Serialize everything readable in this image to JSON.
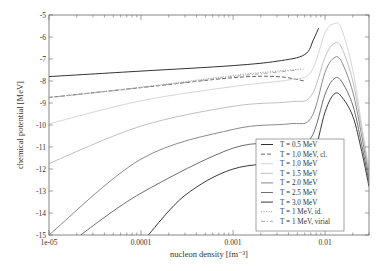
{
  "chart_data": {
    "type": "line",
    "title": "",
    "xlabel": "nucleon density [fm⁻³]",
    "ylabel": "chemical potential [MeV]",
    "xscale": "log",
    "xlim": [
      1e-05,
      0.03
    ],
    "ylim": [
      -15,
      -5
    ],
    "x_ticks": [
      {
        "value": 1e-05,
        "label": "1e-05"
      },
      {
        "value": 0.0001,
        "label": "0.0001"
      },
      {
        "value": 0.001,
        "label": "0.001"
      },
      {
        "value": 0.01,
        "label": "0.01"
      }
    ],
    "y_ticks": [
      {
        "value": -5,
        "label": "-5"
      },
      {
        "value": -6,
        "label": "-6"
      },
      {
        "value": -7,
        "label": "-7"
      },
      {
        "value": -8,
        "label": "-8"
      },
      {
        "value": -9,
        "label": "-9"
      },
      {
        "value": -10,
        "label": "-10"
      },
      {
        "value": -11,
        "label": "-11"
      },
      {
        "value": -12,
        "label": "-12"
      },
      {
        "value": -13,
        "label": "-13"
      },
      {
        "value": -14,
        "label": "-14"
      },
      {
        "value": -15,
        "label": "-15"
      }
    ],
    "grid": false,
    "legend_position": "bottom-right",
    "series": [
      {
        "name": "T = 0.5 MeV",
        "color": "#333333",
        "dash": "solid",
        "x": [
          1e-05,
          0.0001,
          0.001,
          0.003,
          0.006,
          0.0075,
          0.0085
        ],
        "y": [
          -7.8,
          -7.55,
          -7.3,
          -7.1,
          -6.8,
          -6.1,
          -5.6
        ]
      },
      {
        "name": "T = 1.0 MeV, cl.",
        "color": "#666666",
        "dash": "dashed",
        "x": [
          1e-05,
          0.0001,
          0.001,
          0.003,
          0.006
        ],
        "y": [
          -8.75,
          -8.3,
          -7.85,
          -7.8,
          -8.0
        ]
      },
      {
        "name": "T = 1.0 MeV",
        "color": "#d6d6d6",
        "dash": "solid",
        "x": [
          1e-05,
          0.0001,
          0.001,
          0.004,
          0.007,
          0.01,
          0.0125,
          0.015,
          0.02,
          0.025,
          0.03
        ],
        "y": [
          -9.95,
          -8.9,
          -8.25,
          -7.95,
          -7.6,
          -5.8,
          -5.4,
          -5.6,
          -7.5,
          -10.0,
          -12.0
        ]
      },
      {
        "name": "T = 1.5 MeV",
        "color": "#c0c0c0",
        "dash": "solid",
        "x": [
          1e-05,
          0.0001,
          0.001,
          0.004,
          0.007,
          0.01,
          0.0125,
          0.015,
          0.02,
          0.025,
          0.03
        ],
        "y": [
          -11.75,
          -10.05,
          -9.15,
          -8.95,
          -8.7,
          -6.9,
          -6.3,
          -6.45,
          -8.0,
          -10.2,
          -12.2
        ]
      },
      {
        "name": "T = 2.0 MeV",
        "color": "#8a8a8a",
        "dash": "solid",
        "x": [
          1e-05,
          0.0001,
          0.001,
          0.004,
          0.007,
          0.01,
          0.0125,
          0.015,
          0.02,
          0.025,
          0.03
        ],
        "y": [
          -15.0,
          -11.55,
          -10.2,
          -9.95,
          -9.7,
          -7.6,
          -6.95,
          -7.1,
          -8.5,
          -10.5,
          -12.4
        ]
      },
      {
        "name": "T = 2.5 MeV",
        "color": "#6e6e6e",
        "dash": "solid",
        "x": [
          2.2e-05,
          0.0001,
          0.001,
          0.004,
          0.007,
          0.01,
          0.0125,
          0.015,
          0.02,
          0.025,
          0.03
        ],
        "y": [
          -15.0,
          -13.1,
          -11.05,
          -10.85,
          -10.6,
          -8.6,
          -7.9,
          -8.0,
          -9.1,
          -10.9,
          -12.6
        ]
      },
      {
        "name": "T = 3.0 MeV",
        "color": "#3a3a3a",
        "dash": "solid",
        "x": [
          0.00012,
          0.0003,
          0.001,
          0.004,
          0.007,
          0.01,
          0.0125,
          0.015,
          0.02,
          0.025,
          0.03
        ],
        "y": [
          -15.0,
          -13.2,
          -12.0,
          -11.7,
          -11.6,
          -9.4,
          -8.6,
          -8.7,
          -9.6,
          -11.2,
          -12.8
        ]
      },
      {
        "name": "T = 1 MeV, id.",
        "color": "#9a9a9a",
        "dash": "dotted",
        "x": [
          1e-05,
          0.0001,
          0.001,
          0.003,
          0.006
        ],
        "y": [
          -8.75,
          -8.28,
          -7.75,
          -7.55,
          -7.45
        ]
      },
      {
        "name": "T = 1 MeV, virial",
        "color": "#a8a8a8",
        "dash": "dashdot",
        "x": [
          1e-05,
          0.0001,
          0.001,
          0.003,
          0.005
        ],
        "y": [
          -8.75,
          -8.3,
          -7.8,
          -7.6,
          -7.5
        ]
      }
    ]
  }
}
